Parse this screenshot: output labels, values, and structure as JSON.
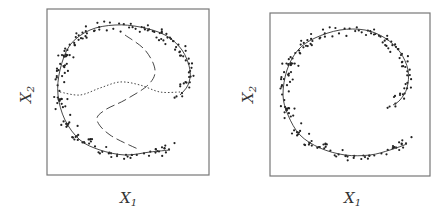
{
  "chart_data": [
    {
      "type": "scatter",
      "title": "",
      "xlabel": "X1",
      "ylabel": "X2",
      "grid": false,
      "legend": null,
      "box": {
        "x": 47,
        "y": 9,
        "w": 162,
        "h": 166
      },
      "curves": [
        {
          "name": "principal curve",
          "style": "solid",
          "points": [
            [
              170,
              150
            ],
            [
              150,
              152
            ],
            [
              125,
              155
            ],
            [
              100,
              150
            ],
            [
              80,
              140
            ],
            [
              65,
              120
            ],
            [
              58,
              95
            ],
            [
              60,
              70
            ],
            [
              70,
              45
            ],
            [
              90,
              30
            ],
            [
              115,
              25
            ],
            [
              140,
              27
            ],
            [
              165,
              35
            ],
            [
              182,
              50
            ],
            [
              190,
              70
            ],
            [
              188,
              85
            ],
            [
              180,
              95
            ]
          ]
        },
        {
          "name": "dashed curve",
          "style": "dashed",
          "points": [
            [
              125,
              35
            ],
            [
              145,
              50
            ],
            [
              155,
              70
            ],
            [
              148,
              85
            ],
            [
              125,
              100
            ],
            [
              105,
              110
            ],
            [
              97,
              120
            ],
            [
              110,
              135
            ],
            [
              140,
              150
            ]
          ]
        },
        {
          "name": "dotted curve",
          "style": "dotted",
          "points": [
            [
              60,
              92
            ],
            [
              80,
              95
            ],
            [
              100,
              88
            ],
            [
              120,
              82
            ],
            [
              140,
              85
            ],
            [
              160,
              92
            ],
            [
              180,
              92
            ]
          ]
        }
      ]
    },
    {
      "type": "scatter",
      "title": "",
      "xlabel": "X1",
      "ylabel": "X2",
      "grid": false,
      "legend": null,
      "box": {
        "x": 270,
        "y": 13,
        "w": 160,
        "h": 163
      },
      "curves": [
        {
          "name": "principal curve",
          "style": "solid",
          "points": [
            [
              407,
              144
            ],
            [
              390,
              150
            ],
            [
              370,
              155
            ],
            [
              345,
              155
            ],
            [
              320,
              148
            ],
            [
              300,
              135
            ],
            [
              288,
              115
            ],
            [
              283,
              95
            ],
            [
              287,
              70
            ],
            [
              298,
              50
            ],
            [
              315,
              38
            ],
            [
              340,
              30
            ],
            [
              365,
              30
            ],
            [
              385,
              38
            ],
            [
              400,
              52
            ],
            [
              408,
              70
            ],
            [
              407,
              88
            ],
            [
              400,
              100
            ],
            [
              393,
              105
            ]
          ]
        }
      ]
    }
  ],
  "labels": {
    "left_x": "X",
    "left_x_sub": "1",
    "left_y": "X",
    "left_y_sub": "2",
    "right_x": "X",
    "right_x_sub": "1",
    "right_y": "X",
    "right_y_sub": "2"
  }
}
